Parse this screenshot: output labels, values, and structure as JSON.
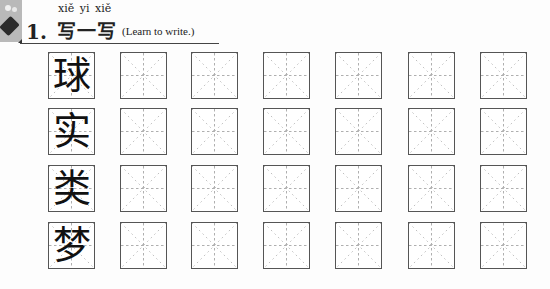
{
  "header": {
    "icon": "brush-ink-icon",
    "number": "1.",
    "pinyin": "xiě  yi  xiě",
    "title": "写一写",
    "subtitle": "(Learn to write.)"
  },
  "grid": {
    "columns": 7,
    "rows": [
      {
        "character": "球"
      },
      {
        "character": "实"
      },
      {
        "character": "类"
      },
      {
        "character": "梦"
      }
    ],
    "cell_type": "米字格",
    "guide_color": "#999999",
    "border_color": "#555555"
  }
}
